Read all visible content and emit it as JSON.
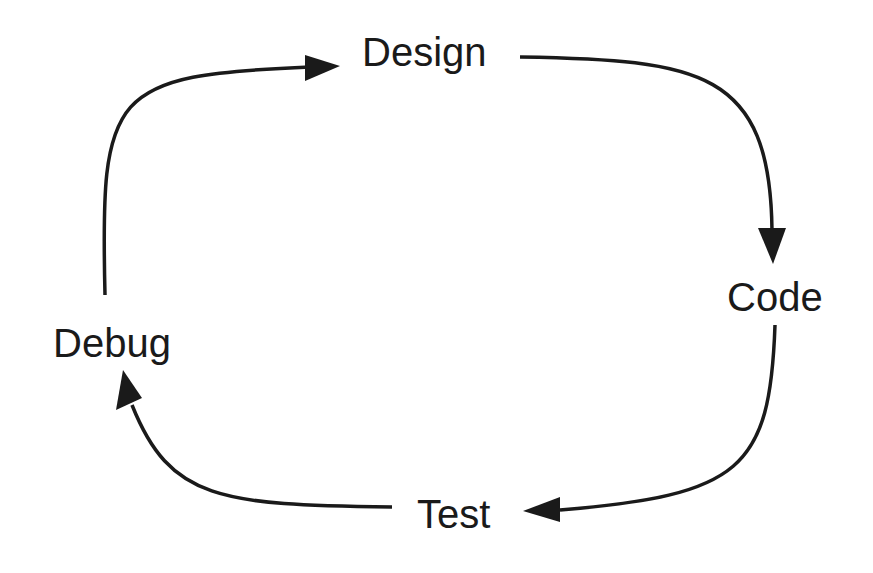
{
  "diagram": {
    "type": "cycle",
    "nodes": [
      {
        "id": "design",
        "label": "Design"
      },
      {
        "id": "code",
        "label": "Code"
      },
      {
        "id": "test",
        "label": "Test"
      },
      {
        "id": "debug",
        "label": "Debug"
      }
    ],
    "edges": [
      {
        "from": "design",
        "to": "code"
      },
      {
        "from": "code",
        "to": "test"
      },
      {
        "from": "test",
        "to": "debug"
      },
      {
        "from": "debug",
        "to": "design"
      }
    ],
    "colors": {
      "stroke": "#1a1a1a",
      "background": "#ffffff"
    }
  }
}
